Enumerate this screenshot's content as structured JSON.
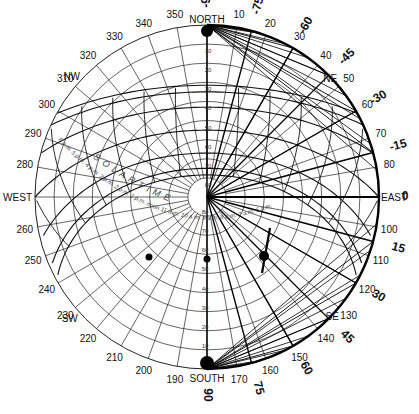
{
  "diagram": {
    "type": "sun-path-chart",
    "center": {
      "x": 207,
      "y": 197
    },
    "radius": 172,
    "colors": {
      "line": "#111111",
      "thin": "#222222",
      "background": "#ffffff"
    },
    "cardinals": [
      {
        "label": "NORTH",
        "az": 0
      },
      {
        "label": "EAST",
        "az": 90
      },
      {
        "label": "SOUTH",
        "az": 180
      },
      {
        "label": "WEST",
        "az": 270
      }
    ],
    "intercardinals": [
      {
        "label": "NE",
        "az": 45
      },
      {
        "label": "SE",
        "az": 135
      },
      {
        "label": "SW",
        "az": 225
      },
      {
        "label": "NW",
        "az": 315
      }
    ],
    "azimuth_labels": [
      "10",
      "20",
      "30",
      "40",
      "50",
      "60",
      "70",
      "80",
      "100",
      "110",
      "120",
      "130",
      "140",
      "150",
      "160",
      "170",
      "190",
      "200",
      "210",
      "220",
      "230",
      "240",
      "250",
      "260",
      "280",
      "290",
      "300",
      "310",
      "320",
      "330",
      "340",
      "350"
    ],
    "altitude_labels_north": [
      "0",
      "10",
      "20",
      "30",
      "40",
      "50",
      "60",
      "70",
      "80"
    ],
    "altitude_labels_south": [
      "80",
      "70",
      "60",
      "50",
      "40",
      "30",
      "20",
      "10",
      "0"
    ],
    "protractor_labels": [
      {
        "label": "-90",
        "az": 0
      },
      {
        "label": "-75",
        "az": 15
      },
      {
        "label": "-60",
        "az": 30
      },
      {
        "label": "-45",
        "az": 45
      },
      {
        "label": "-30",
        "az": 60
      },
      {
        "label": "-15",
        "az": 75
      },
      {
        "label": "0",
        "az": 90
      },
      {
        "label": "15",
        "az": 105
      },
      {
        "label": "30",
        "az": 120
      },
      {
        "label": "45",
        "az": 135
      },
      {
        "label": "60",
        "az": 150
      },
      {
        "label": "75",
        "az": 165
      },
      {
        "label": "90",
        "az": 180
      }
    ],
    "inner_protractor_labels": [
      "15",
      "30",
      "45",
      "60",
      "75"
    ],
    "solar_time_label": "S O L A R   T I M E",
    "time_labels": [
      "6 p.m.",
      "5 p.m.",
      "4 p.m.",
      "3 p.m.",
      "2 p.m.",
      "1 p.m.",
      "noon",
      "11 a.m.",
      "10 a.m.",
      "9 a.m.",
      "8 a.m.",
      "7 a.m.",
      "6 a.m."
    ],
    "date_labels": [
      "21",
      "15'",
      "15'",
      "10'",
      "15'",
      "25'",
      "28' 27'"
    ]
  }
}
